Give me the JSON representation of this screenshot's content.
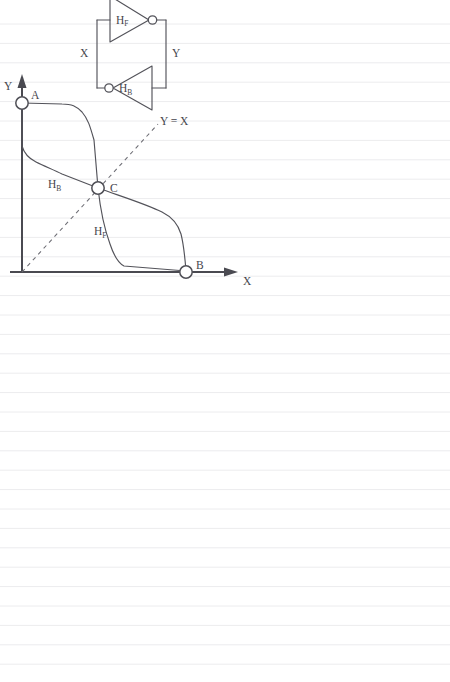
{
  "page": {
    "background_color": "#ffffff",
    "ink_color": "#53535a",
    "rule_color": "#ececee",
    "width": 450,
    "height": 682
  },
  "ruled_paper": {
    "name": "ruled-notebook-lines",
    "first_line_y": 24,
    "line_spacing": 19.4,
    "line_count": 34,
    "left_margin": 0,
    "right_margin": 450
  },
  "figure": {
    "name": "cross-coupled-inverter-butterfly-plot",
    "circuit": {
      "title": "cross-coupled inverter pair",
      "node_label_left": "X",
      "node_label_right": "Y",
      "inverters": [
        {
          "id": "HF",
          "label": "H",
          "subscript": "F",
          "direction": "right",
          "bubble_side": "right"
        },
        {
          "id": "HB",
          "label": "H",
          "subscript": "B",
          "direction": "left",
          "bubble_side": "left"
        }
      ]
    },
    "plot": {
      "axis_x_label": "X",
      "axis_y_label": "Y",
      "diagonal_label": "Y = X",
      "curves": [
        {
          "id": "HF",
          "label": "H",
          "subscript": "F"
        },
        {
          "id": "HB",
          "label": "H",
          "subscript": "B"
        }
      ],
      "points": [
        {
          "id": "A",
          "label": "A",
          "desc": "high-Y stable state on Y axis"
        },
        {
          "id": "B",
          "label": "B",
          "desc": "high-X stable state on X axis"
        },
        {
          "id": "C",
          "label": "C",
          "desc": "metastable crossing point on Y = X"
        }
      ]
    }
  },
  "chart_data": {
    "type": "line",
    "title": "",
    "xlabel": "X",
    "ylabel": "Y",
    "xlim": [
      0,
      1
    ],
    "ylim": [
      0,
      1
    ],
    "grid": false,
    "legend": "inline-annotations",
    "annotations": [
      {
        "text": "Y = X",
        "x": 0.84,
        "y": 0.9
      },
      {
        "text": "A",
        "x": 0.04,
        "y": 1.0
      },
      {
        "text": "B",
        "x": 1.0,
        "y": 0.04
      },
      {
        "text": "C",
        "x": 0.5,
        "y": 0.5
      },
      {
        "text": "HF",
        "x": 0.45,
        "y": 0.25
      },
      {
        "text": "HB",
        "x": 0.17,
        "y": 0.53
      }
    ],
    "series": [
      {
        "name": "HF",
        "style": "solid",
        "x": [
          0.0,
          0.28,
          0.36,
          0.44,
          0.5,
          0.56,
          0.6,
          0.62,
          0.7,
          1.0
        ],
        "y": [
          1.0,
          0.98,
          0.92,
          0.66,
          0.5,
          0.28,
          0.12,
          0.05,
          0.02,
          0.01
        ]
      },
      {
        "name": "HB",
        "style": "solid",
        "x": [
          0.0,
          0.01,
          0.06,
          0.3,
          0.5,
          0.72,
          0.88,
          0.94,
          0.97,
          0.99
        ],
        "y": [
          1.0,
          0.75,
          0.7,
          0.6,
          0.5,
          0.4,
          0.34,
          0.26,
          0.1,
          0.01
        ]
      },
      {
        "name": "Y = X",
        "style": "dashed",
        "x": [
          0.0,
          1.0
        ],
        "y": [
          0.0,
          1.0
        ]
      }
    ],
    "markers": [
      {
        "label": "A",
        "x": 0.0,
        "y": 1.0
      },
      {
        "label": "C",
        "x": 0.5,
        "y": 0.5
      },
      {
        "label": "B",
        "x": 0.99,
        "y": 0.0
      }
    ]
  }
}
